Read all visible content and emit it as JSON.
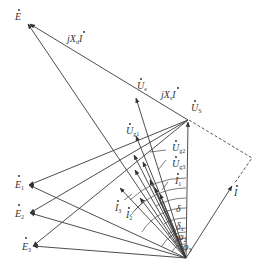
{
  "diagram": {
    "type": "phasor-diagram",
    "origin": {
      "x": 186,
      "y": 258
    },
    "labels": {
      "E": {
        "main": "E",
        "sub": ""
      },
      "jXdI": {
        "main": "jX",
        "sub": "d",
        "tail": "I"
      },
      "Ue": {
        "main": "U",
        "sub": "e"
      },
      "jXsI": {
        "main": "jX",
        "sub": "s",
        "tail": "I"
      },
      "Us": {
        "main": "U",
        "sub": "S"
      },
      "Ug1": {
        "main": "U",
        "sub": "g1"
      },
      "Ug2": {
        "main": "U",
        "sub": "g2"
      },
      "Ug3": {
        "main": "U",
        "sub": "g3"
      },
      "I1": {
        "main": "I",
        "sub": "1"
      },
      "I2": {
        "main": "I",
        "sub": "2"
      },
      "I3": {
        "main": "I",
        "sub": "3"
      },
      "I": {
        "main": "I",
        "sub": ""
      },
      "E1": {
        "main": "E",
        "sub": "1"
      },
      "E2": {
        "main": "E",
        "sub": "2"
      },
      "E3": {
        "main": "E",
        "sub": "3"
      },
      "delta": {
        "main": "δ",
        "sub": ""
      },
      "delta1": {
        "main": "δ",
        "sub": "1"
      },
      "phi2": {
        "main": "φ",
        "sub": "2"
      },
      "phi3": {
        "main": "φ",
        "sub": "3"
      }
    }
  }
}
